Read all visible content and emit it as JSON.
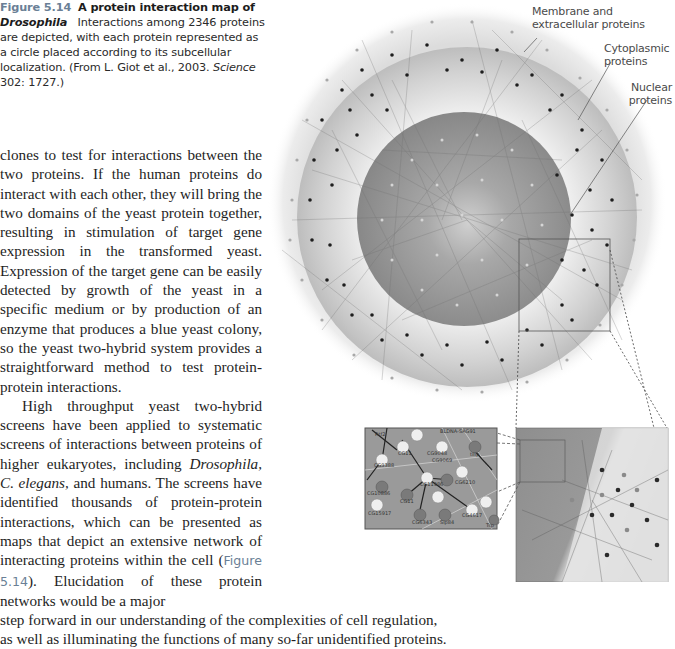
{
  "caption": {
    "figure_number": "Figure 5.14",
    "title_part1": "A protein interaction map of",
    "title_italic": "Drosophila",
    "text": "Interactions among 2346 proteins are depicted, with each protein represented as a circle placed according to its subcellular localization. (From L. Giot et al., 2003.",
    "journal": "Science",
    "citation": "302: 1727.)"
  },
  "body": {
    "para1": "clones to test for interactions between the two proteins. If the human proteins do interact with each other, they will bring the two domains of the yeast protein together, resulting in stimulation of target gene expression in the transformed yeast. Expression of the target gene can be easily detected by growth of the yeast in a specific medium or by production of an enzyme that produces a blue yeast colony, so the yeast two-hybrid system provides a straightforward method to test protein-protein interactions.",
    "para2_start": "High throughput yeast two-hybrid screens have been applied to systematic screens of interactions between proteins of higher eukaryotes, including",
    "para2_italic1": "Drosophila, C. elegans,",
    "para2_mid": "and humans. The screens have identified thousands of protein-protein interactions, which can be presented as maps that depict an extensive network of interacting proteins within the cell (",
    "para2_figref": "Figure 5.14",
    "para2_after_ref": "). Elucidation of these protein networks would be a major",
    "para2_wide1": "step forward in our understanding of the complexities of cell regulation,",
    "para2_wide2": "as well as illuminating the functions of many so-far unidentified proteins."
  },
  "figure": {
    "labels": {
      "membrane_line1": "Membrane and",
      "membrane_line2": "extracellular proteins",
      "cyto_line1": "Cytoplasmic",
      "cyto_line2": "proteins",
      "nuclear_line1": "Nuclear",
      "nuclear_line2": "proteins"
    },
    "inset_node_labels": [
      "Rtf2",
      "BLDNA-SAG91",
      "CG9388",
      "CG11",
      "CG9048",
      "CG9069",
      "tilip",
      "CG11986",
      "CG6210",
      "CG10886",
      "CG11",
      "CG15917",
      "CG6343",
      "CG4617",
      "Sip84",
      "Tsp"
    ]
  },
  "colors": {
    "accent": "#6a7f96",
    "text": "#1e1e1e",
    "nucleus": "#8d8d8d",
    "cytoplasm": "#c4c4c4",
    "membrane": "#e6e6e6"
  }
}
